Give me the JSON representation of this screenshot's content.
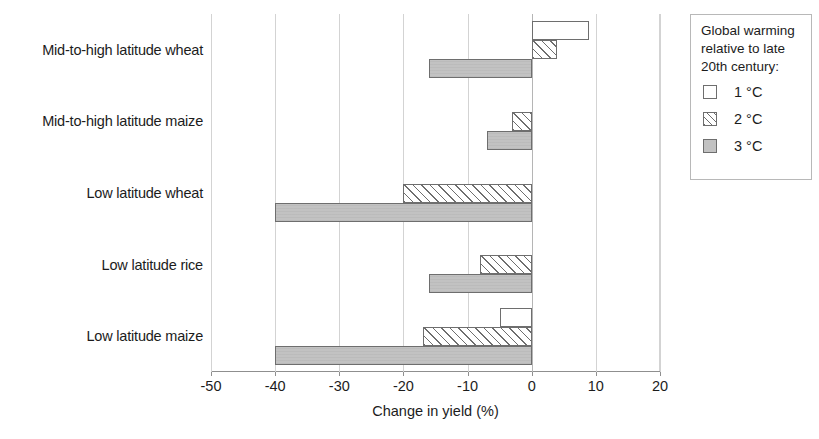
{
  "chart_data": {
    "type": "bar",
    "orientation": "horizontal",
    "title": "",
    "xlabel": "Change in yield (%)",
    "ylabel": "",
    "xlim": [
      -50,
      20
    ],
    "xticks": [
      -50,
      -40,
      -30,
      -20,
      -10,
      0,
      10,
      20
    ],
    "xtick_labels": [
      "-50",
      "-40",
      "-30",
      "-20",
      "-10",
      "0",
      "10",
      "20"
    ],
    "grid": true,
    "grid_axis": "x",
    "legend_position": "right",
    "legend_title": "Global warming relative to late 20th century:",
    "categories": [
      "Mid-to-high latitude wheat",
      "Mid-to-high latitude maize",
      "Low latitude wheat",
      "Low latitude rice",
      "Low latitude maize"
    ],
    "series": [
      {
        "name": "1 °C",
        "style": "white",
        "values": [
          9,
          null,
          null,
          null,
          -5
        ]
      },
      {
        "name": "2 °C",
        "style": "hatched",
        "values": [
          4,
          -3,
          -20,
          -8,
          -17
        ]
      },
      {
        "name": "3 °C",
        "style": "grey",
        "values": [
          -16,
          -7,
          -40,
          -16,
          -40
        ]
      }
    ]
  },
  "legend": {
    "title_lines": [
      "Global warming",
      "relative to late",
      "20th century:"
    ],
    "entries": [
      {
        "label": "1 °C",
        "style": "s1"
      },
      {
        "label": "2 °C",
        "style": "s2"
      },
      {
        "label": "3 °C",
        "style": "s3"
      }
    ]
  },
  "colors": {
    "bar_outline": "#6e6e6e",
    "bar_grey_fill": "#c2c2c2",
    "bar_white_fill": "#ffffff",
    "gridline": "#d3d3d3",
    "axis": "#8f8f8f",
    "text": "#1c1c1c"
  }
}
